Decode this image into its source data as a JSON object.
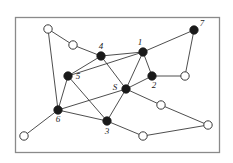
{
  "figure": {
    "type": "network-graph-diagram",
    "background_color": "#ffffff",
    "border": {
      "color": "#8a8a8a",
      "x": 15,
      "y": 17,
      "width": 204,
      "height": 135
    },
    "edge_color": "#3a3a3a",
    "filled_node_color": "#1a1a1a",
    "open_node_fill": "#ffffff",
    "open_node_stroke": "#3a3a3a",
    "node_radius": 4.2,
    "nodes": [
      {
        "id": "w1",
        "label": "",
        "x": 48,
        "y": 29,
        "filled": false,
        "label_dx": 0,
        "label_dy": 0
      },
      {
        "id": "w2",
        "label": "",
        "x": 73,
        "y": 45,
        "filled": false,
        "label_dx": 0,
        "label_dy": 0
      },
      {
        "id": "n4",
        "label": "4",
        "x": 101,
        "y": 56,
        "filled": true,
        "label_dx": 0,
        "label_dy": -7
      },
      {
        "id": "n1",
        "label": "1",
        "x": 143,
        "y": 52,
        "filled": true,
        "label_dx": -3,
        "label_dy": -7
      },
      {
        "id": "n7",
        "label": "7",
        "x": 194,
        "y": 30,
        "filled": true,
        "label_dx": 8,
        "label_dy": -4
      },
      {
        "id": "n5",
        "label": "5",
        "x": 68,
        "y": 76,
        "filled": true,
        "label_dx": 10,
        "label_dy": 3
      },
      {
        "id": "n2",
        "label": "2",
        "x": 152,
        "y": 76,
        "filled": true,
        "label_dx": 2,
        "label_dy": 12
      },
      {
        "id": "w3",
        "label": "",
        "x": 185,
        "y": 76,
        "filled": false,
        "label_dx": 0,
        "label_dy": 0
      },
      {
        "id": "nS",
        "label": "S",
        "x": 126,
        "y": 89,
        "filled": true,
        "label_dx": -11,
        "label_dy": 1
      },
      {
        "id": "w4",
        "label": "",
        "x": 161,
        "y": 105,
        "filled": false,
        "label_dx": 0,
        "label_dy": 0
      },
      {
        "id": "n6",
        "label": "6",
        "x": 58,
        "y": 110,
        "filled": true,
        "label_dx": 0,
        "label_dy": 12
      },
      {
        "id": "n3",
        "label": "3",
        "x": 107,
        "y": 121,
        "filled": true,
        "label_dx": 0,
        "label_dy": 13
      },
      {
        "id": "w5",
        "label": "",
        "x": 208,
        "y": 125,
        "filled": false,
        "label_dx": 0,
        "label_dy": 0
      },
      {
        "id": "w6",
        "label": "",
        "x": 24,
        "y": 136,
        "filled": false,
        "label_dx": 0,
        "label_dy": 0
      },
      {
        "id": "w7",
        "label": "",
        "x": 143,
        "y": 136,
        "filled": false,
        "label_dx": 0,
        "label_dy": 0
      }
    ],
    "edges": [
      {
        "from": "w1",
        "to": "w2"
      },
      {
        "from": "w1",
        "to": "n6"
      },
      {
        "from": "w2",
        "to": "n4"
      },
      {
        "from": "n4",
        "to": "n5"
      },
      {
        "from": "n4",
        "to": "nS"
      },
      {
        "from": "n1",
        "to": "n4"
      },
      {
        "from": "n1",
        "to": "n7"
      },
      {
        "from": "n1",
        "to": "n2"
      },
      {
        "from": "n1",
        "to": "nS"
      },
      {
        "from": "n1",
        "to": "n5"
      },
      {
        "from": "n7",
        "to": "w3"
      },
      {
        "from": "n2",
        "to": "w3"
      },
      {
        "from": "n2",
        "to": "nS"
      },
      {
        "from": "n5",
        "to": "n6"
      },
      {
        "from": "n5",
        "to": "n3"
      },
      {
        "from": "nS",
        "to": "n3"
      },
      {
        "from": "nS",
        "to": "n6"
      },
      {
        "from": "nS",
        "to": "w4"
      },
      {
        "from": "w4",
        "to": "w5"
      },
      {
        "from": "n6",
        "to": "n3"
      },
      {
        "from": "n6",
        "to": "w6"
      },
      {
        "from": "n3",
        "to": "w7"
      },
      {
        "from": "w7",
        "to": "w5"
      }
    ]
  }
}
